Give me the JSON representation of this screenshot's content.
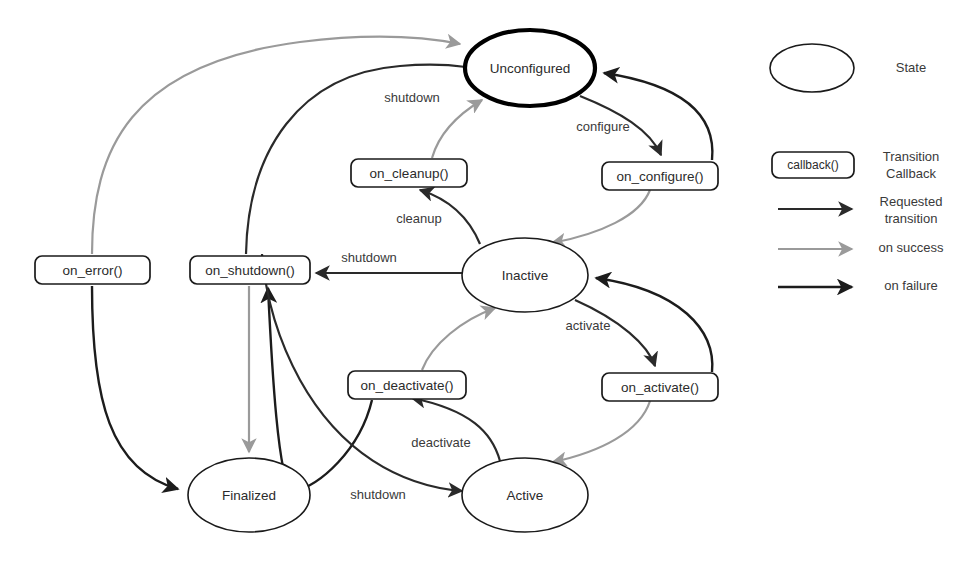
{
  "diagram": {
    "background": "#ffffff"
  },
  "colors": {
    "requested_transition": "#2a2a2a",
    "on_success": "#9a9a9a",
    "on_failure": "#1c1c1c",
    "state_border": "#1a1a1a",
    "primary_state_border": "#000000",
    "text": "#2b2b2b"
  },
  "states": [
    {
      "id": "unconfigured",
      "label": "Unconfigured",
      "primary": true,
      "cx": 530,
      "cy": 68,
      "rx": 65,
      "ry": 38
    },
    {
      "id": "inactive",
      "label": "Inactive",
      "primary": false,
      "cx": 525,
      "cy": 275,
      "rx": 63,
      "ry": 37
    },
    {
      "id": "active",
      "label": "Active",
      "primary": false,
      "cx": 525,
      "cy": 495,
      "rx": 63,
      "ry": 37
    },
    {
      "id": "finalized",
      "label": "Finalized",
      "primary": false,
      "cx": 249,
      "cy": 495,
      "rx": 61,
      "ry": 37
    }
  ],
  "callbacks": [
    {
      "id": "on_error",
      "label": "on_error()",
      "x": 35,
      "y": 256,
      "w": 115,
      "h": 28
    },
    {
      "id": "on_shutdown",
      "label": "on_shutdown()",
      "x": 190,
      "y": 256,
      "w": 120,
      "h": 28
    },
    {
      "id": "on_cleanup",
      "label": "on_cleanup()",
      "x": 351,
      "y": 159,
      "w": 116,
      "h": 28
    },
    {
      "id": "on_configure",
      "label": "on_configure()",
      "x": 602,
      "y": 162,
      "w": 116,
      "h": 28
    },
    {
      "id": "on_deactivate",
      "label": "on_deactivate()",
      "x": 348,
      "y": 371,
      "w": 118,
      "h": 28
    },
    {
      "id": "on_activate",
      "label": "on_activate()",
      "x": 602,
      "y": 373,
      "w": 116,
      "h": 28
    }
  ],
  "edge_labels": [
    {
      "id": "shutdown-top",
      "text": "shutdown",
      "x": 412,
      "y": 99
    },
    {
      "id": "configure",
      "text": "configure",
      "x": 603,
      "y": 128
    },
    {
      "id": "cleanup",
      "text": "cleanup",
      "x": 419,
      "y": 220
    },
    {
      "id": "shutdown-middle",
      "text": "shutdown",
      "x": 369,
      "y": 259
    },
    {
      "id": "activate",
      "text": "activate",
      "x": 588,
      "y": 327
    },
    {
      "id": "deactivate",
      "text": "deactivate",
      "x": 441,
      "y": 444
    },
    {
      "id": "shutdown-bottom",
      "text": "shutdown",
      "x": 378,
      "y": 496
    }
  ],
  "legend": {
    "items": [
      {
        "id": "state",
        "kind": "ellipse",
        "label": "State"
      },
      {
        "id": "callback",
        "kind": "box",
        "label": "Transition\nCallback",
        "label_line1": "Transition",
        "label_line2": "Callback",
        "box_text": "callback()"
      },
      {
        "id": "requested",
        "kind": "arrow",
        "label": "Requested\ntransition",
        "label_line1": "Requested",
        "label_line2": "transition",
        "color": "#2a2a2a"
      },
      {
        "id": "on-success",
        "kind": "arrow",
        "label": "on success",
        "label_line1": "on success",
        "color": "#9a9a9a"
      },
      {
        "id": "on-failure",
        "kind": "arrow",
        "label": "on failure",
        "label_line1": "on failure",
        "color": "#1c1c1c"
      }
    ]
  }
}
